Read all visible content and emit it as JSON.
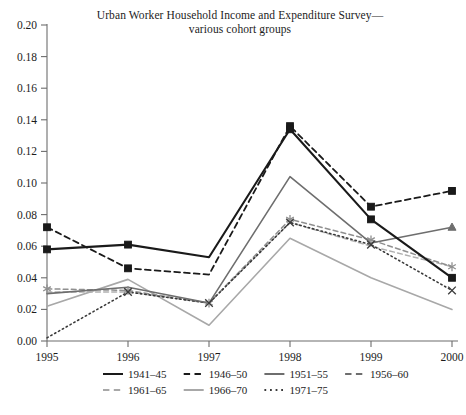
{
  "chart_data": {
    "type": "line",
    "title": "Urban Worker Household Income and Expenditure Survey—",
    "subtitle": "various cohort groups",
    "xlabel": "",
    "ylabel": "",
    "x": [
      "1995",
      "1996",
      "1997",
      "1998",
      "1999",
      "2000"
    ],
    "xtick_labels": [
      "1995",
      "1996",
      "1997",
      "1998",
      "1999",
      "2000"
    ],
    "ytick_labels": [
      "0.00",
      "0.02",
      "0.04",
      "0.06",
      "0.08",
      "0.10",
      "0.12",
      "0.14",
      "0.16",
      "0.18",
      "0.20"
    ],
    "ylim": [
      0.0,
      0.2
    ],
    "ytick_step": 0.02,
    "grid": false,
    "legend_position": "below-axes",
    "series": [
      {
        "name": "1941–45",
        "values": [
          0.058,
          0.061,
          0.053,
          0.134,
          0.077,
          0.04
        ],
        "color": "#1a1a1a",
        "dash": "solid",
        "marker": "square",
        "width": 2.1
      },
      {
        "name": "1946–50",
        "values": [
          0.072,
          0.046,
          0.042,
          0.136,
          0.085,
          0.095
        ],
        "color": "#1a1a1a",
        "dash": "dashed",
        "marker": "square",
        "width": 1.8
      },
      {
        "name": "1951–55",
        "values": [
          0.03,
          0.034,
          0.024,
          0.104,
          0.062,
          0.072
        ],
        "color": "#6e6e6e",
        "dash": "solid",
        "marker": "triangle",
        "width": 1.6
      },
      {
        "name": "1956–60",
        "values": [
          0.033,
          0.032,
          0.024,
          0.077,
          0.064,
          0.047
        ],
        "color": "#8f8f8f",
        "dash": "dashed",
        "marker": "asterisk",
        "width": 1.5
      },
      {
        "name": "1961–65",
        "values": [
          0.031,
          0.031,
          0.024,
          0.075,
          0.06,
          0.047
        ],
        "color": "#b0b0b0",
        "dash": "dashed",
        "marker": "none",
        "width": 1.5
      },
      {
        "name": "1966–70",
        "values": [
          0.022,
          0.039,
          0.01,
          0.065,
          0.04,
          0.02
        ],
        "color": "#a8a8a8",
        "dash": "solid",
        "marker": "none",
        "width": 1.6
      },
      {
        "name": "1971–75",
        "values": [
          0.002,
          0.031,
          0.024,
          0.075,
          0.061,
          0.032
        ],
        "color": "#3a3a3a",
        "dash": "dotted",
        "marker": "x",
        "width": 1.6
      }
    ],
    "legend": [
      {
        "label": "1941–45",
        "dash": "solid",
        "color": "#1a1a1a"
      },
      {
        "label": "1946–50",
        "dash": "dashed",
        "color": "#1a1a1a"
      },
      {
        "label": "1951–55",
        "dash": "solid",
        "color": "#6e6e6e"
      },
      {
        "label": "1956–60",
        "dash": "dashed",
        "color": "#6e6e6e"
      },
      {
        "label": "1961–65",
        "dash": "dashed",
        "color": "#a8a8a8"
      },
      {
        "label": "1966–70",
        "dash": "solid",
        "color": "#a8a8a8"
      },
      {
        "label": "1971–75",
        "dash": "dotted",
        "color": "#3a3a3a"
      }
    ],
    "axis_color": "#6d6d6d"
  }
}
